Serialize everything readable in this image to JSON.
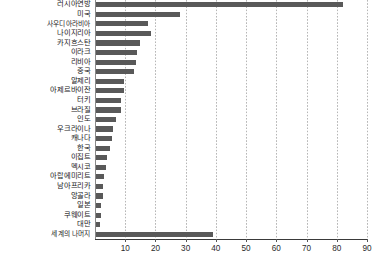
{
  "chart_data": {
    "type": "bar",
    "orientation": "horizontal",
    "title": "",
    "subtitle": "",
    "xlabel": "",
    "ylabel": "",
    "xlim": [
      0,
      90
    ],
    "ylim": null,
    "grid": true,
    "grid_axis": "x",
    "legend": false,
    "legend_position": "none",
    "xticks": [
      10,
      20,
      30,
      40,
      50,
      60,
      70,
      80,
      90
    ],
    "xticklabels": [
      "10",
      "20",
      "30",
      "40",
      "50",
      "60",
      "70",
      "80",
      "90"
    ],
    "bar_color": "#595959",
    "categories": [
      "러시아연방",
      "미국",
      "사우디아라비아",
      "나이지리아",
      "카지흐스탄",
      "이라크",
      "리비아",
      "중국",
      "알제리",
      "아제르바이잔",
      "터키",
      "브라질",
      "인도",
      "우크라이나",
      "캐나다",
      "한국",
      "이집트",
      "멕시코",
      "아랍에미리트",
      "남아프리카",
      "앙골라",
      "일본",
      "쿠웨이트",
      "대만",
      "세계의 나머지"
    ],
    "values": [
      82,
      28,
      17.5,
      18.5,
      15,
      14,
      13.5,
      13,
      9.5,
      9.5,
      8.5,
      8.5,
      7,
      6,
      5.5,
      5,
      4,
      3.5,
      3,
      2.5,
      2.5,
      2,
      2,
      1.5,
      39
    ]
  }
}
